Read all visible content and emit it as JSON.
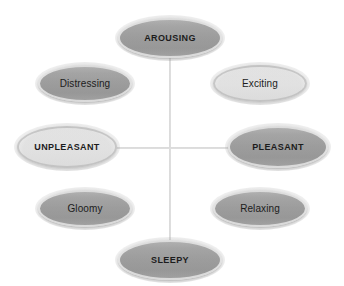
{
  "diagram": {
    "type": "circumplex-model-of-affect",
    "background_color": "#ffffff",
    "axis_line_color": "#cfcfcf",
    "filled_node_color": "#9b9b9b",
    "open_node_color": "#ffffff",
    "node_border_color": "#d2d2d2",
    "text_color": "#1c1c1c",
    "axes": {
      "vertical_label_top": "AROUSING",
      "vertical_label_bottom": "SLEEPY",
      "horizontal_label_left": "UNPLEASANT",
      "horizontal_label_right": "PLEASANT"
    },
    "nodes": [
      {
        "id": "arousing",
        "label": "AROUSING",
        "style": "filled",
        "kind": "axis-label",
        "position": "top"
      },
      {
        "id": "distressing",
        "label": "Distressing",
        "style": "filled",
        "kind": "term",
        "position": "upper-left"
      },
      {
        "id": "exciting",
        "label": "Exciting",
        "style": "open",
        "kind": "term",
        "position": "upper-right"
      },
      {
        "id": "unpleasant",
        "label": "UNPLEASANT",
        "style": "open",
        "kind": "axis-label",
        "position": "left"
      },
      {
        "id": "pleasant",
        "label": "PLEASANT",
        "style": "filled",
        "kind": "axis-label",
        "position": "right"
      },
      {
        "id": "gloomy",
        "label": "Gloomy",
        "style": "filled",
        "kind": "term",
        "position": "lower-left"
      },
      {
        "id": "relaxing",
        "label": "Relaxing",
        "style": "filled",
        "kind": "term",
        "position": "lower-right"
      },
      {
        "id": "sleepy",
        "label": "SLEEPY",
        "style": "filled",
        "kind": "axis-label",
        "position": "bottom"
      }
    ]
  }
}
